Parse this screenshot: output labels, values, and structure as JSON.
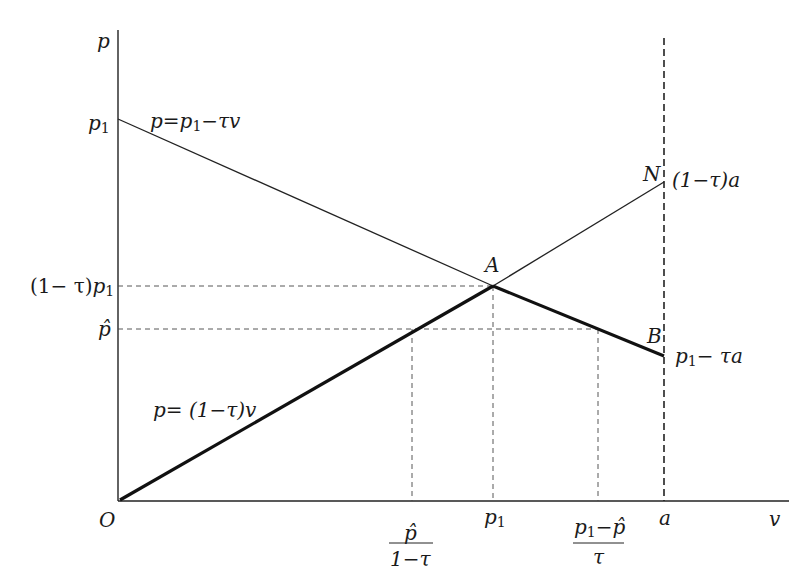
{
  "diagram": {
    "axes": {
      "y_label": "p",
      "x_label": "v",
      "origin_label": "O"
    },
    "y_ticks": {
      "p1": "p",
      "p1_sub": "1",
      "one_minus_tau_p1_prefix": "(1− τ)",
      "one_minus_tau_p1_var": "p",
      "one_minus_tau_p1_sub": "1",
      "p_hat": "p̂"
    },
    "x_ticks": {
      "phat_over_1mtau_num": "p̂",
      "phat_over_1mtau_den": "1−τ",
      "p1": "p",
      "p1_sub": "1",
      "p1mphat_over_tau_num_var": "p",
      "p1mphat_over_tau_num_sub": "1",
      "p1mphat_over_tau_num_rest": "−p̂",
      "p1mphat_over_tau_den": "τ",
      "a": "a"
    },
    "curves": {
      "demand_label_prefix": "p=p",
      "demand_label_sub": "1",
      "demand_label_suffix": "−τv",
      "supply_label": "p= (1−τ)v"
    },
    "points": {
      "A": "A",
      "N": "N",
      "B": "B",
      "N_value": "(1−τ)a",
      "B_value_var": "p",
      "B_value_sub": "1",
      "B_value_rest": "− τa"
    }
  }
}
